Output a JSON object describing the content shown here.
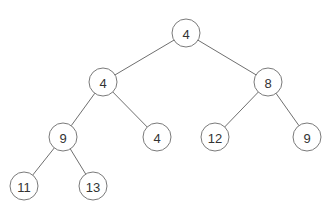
{
  "diagram": {
    "type": "binary-tree",
    "colors": {
      "edge": "#6f6f6f",
      "node_stroke": "#7a7a7a",
      "node_fill": "#ffffff",
      "text": "#333333"
    },
    "node_radius": 14,
    "nodes": [
      {
        "id": "n0",
        "label": "4",
        "x": 186,
        "y": 33
      },
      {
        "id": "n1",
        "label": "4",
        "x": 103,
        "y": 82
      },
      {
        "id": "n2",
        "label": "8",
        "x": 268,
        "y": 82
      },
      {
        "id": "n3",
        "label": "9",
        "x": 63,
        "y": 137
      },
      {
        "id": "n4",
        "label": "4",
        "x": 157,
        "y": 137
      },
      {
        "id": "n5",
        "label": "12",
        "x": 215,
        "y": 137
      },
      {
        "id": "n6",
        "label": "9",
        "x": 307,
        "y": 137
      },
      {
        "id": "n7",
        "label": "11",
        "x": 24,
        "y": 186
      },
      {
        "id": "n8",
        "label": "13",
        "x": 93,
        "y": 186
      }
    ],
    "edges": [
      {
        "from": "n0",
        "to": "n1"
      },
      {
        "from": "n0",
        "to": "n2"
      },
      {
        "from": "n1",
        "to": "n3"
      },
      {
        "from": "n1",
        "to": "n4"
      },
      {
        "from": "n2",
        "to": "n5"
      },
      {
        "from": "n2",
        "to": "n6"
      },
      {
        "from": "n3",
        "to": "n7"
      },
      {
        "from": "n3",
        "to": "n8"
      }
    ]
  }
}
